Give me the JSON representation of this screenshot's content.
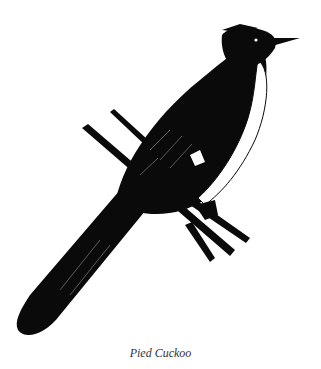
{
  "figure": {
    "caption": "Pied Cuckoo",
    "colors": {
      "ink": "#0a0a0a",
      "paper": "#ffffff",
      "caption": "#333333"
    }
  }
}
